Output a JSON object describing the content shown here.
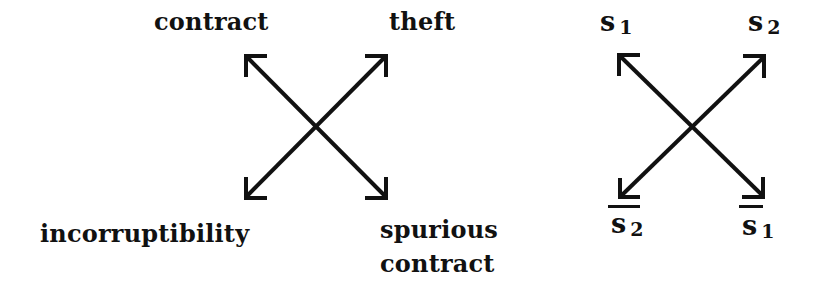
{
  "left_square": {
    "top_left": "contract",
    "top_right": "theft",
    "bottom_left": "incorruptibility",
    "bottom_right_line1": "spurious",
    "bottom_right_line2": "contract"
  },
  "right_square": {
    "top_left": {
      "base": "s",
      "sub": "1",
      "negated": false
    },
    "top_right": {
      "base": "s",
      "sub": "2",
      "negated": false
    },
    "bottom_left": {
      "base": "s",
      "sub": "2",
      "negated": true
    },
    "bottom_right": {
      "base": "s",
      "sub": "1",
      "negated": true
    }
  },
  "colors": {
    "ink": "#111111",
    "background": "#ffffff"
  }
}
